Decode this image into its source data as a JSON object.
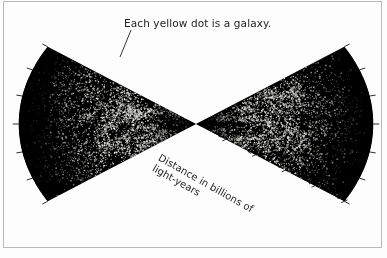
{
  "figure": {
    "background_color": "#fdfdfd",
    "wedge_fill_color": "#000000",
    "galaxy_dot_color": "#e8e8e8",
    "ink_color": "#1d1d1d",
    "border_color": "#b9b9b9"
  },
  "annotations": {
    "caption": "Each yellow dot is a galaxy.",
    "axis_label": "Distance in billions of\nlight-years"
  },
  "chart_data": {
    "type": "scatter",
    "title": "",
    "subtitle": "",
    "xlabel": "Distance in billions of light-years",
    "ylabel": "",
    "annotations": [
      "Each yellow dot is a galaxy."
    ],
    "projection": "polar-wedge-pair",
    "apex": {
      "x": 196,
      "y": 124
    },
    "radial_axis": {
      "label": "Distance in billions of light-years",
      "unit": "billions of light-years",
      "min": 0,
      "max": 5,
      "ticks": [
        0,
        1,
        2,
        3,
        4,
        5
      ],
      "tick_labels": [
        "0",
        "1",
        "2",
        "3",
        "4",
        "5"
      ],
      "labeled_ticks": [
        "1",
        "2",
        "3",
        "4",
        "5"
      ],
      "tick_side": "lower-right edge of right wedge"
    },
    "wedges": [
      {
        "name": "left-wedge",
        "direction": "west",
        "center_angle_deg": 180,
        "half_opening_deg": 28,
        "outer_radius": 5,
        "arc_tick_count": 6
      },
      {
        "name": "right-wedge",
        "direction": "east",
        "center_angle_deg": 0,
        "half_opening_deg": 28,
        "outer_radius": 5,
        "arc_tick_count": 6
      }
    ],
    "series": [
      {
        "name": "galaxies",
        "marker": "dot",
        "marker_color_original": "yellow",
        "marker_color_rendered": "#e8e8e8",
        "point_count_approx": 12000,
        "density_profile": {
          "description": "Galaxy surface density peaks at intermediate distance and falls off toward the outer arc.",
          "distance_bins": [
            0.5,
            1,
            1.5,
            2,
            2.5,
            3,
            3.5,
            4,
            4.5,
            5
          ],
          "relative_density": [
            0.35,
            0.7,
            0.95,
            1.0,
            0.92,
            0.72,
            0.48,
            0.26,
            0.11,
            0.03
          ]
        }
      }
    ],
    "grid": false,
    "legend": false
  }
}
